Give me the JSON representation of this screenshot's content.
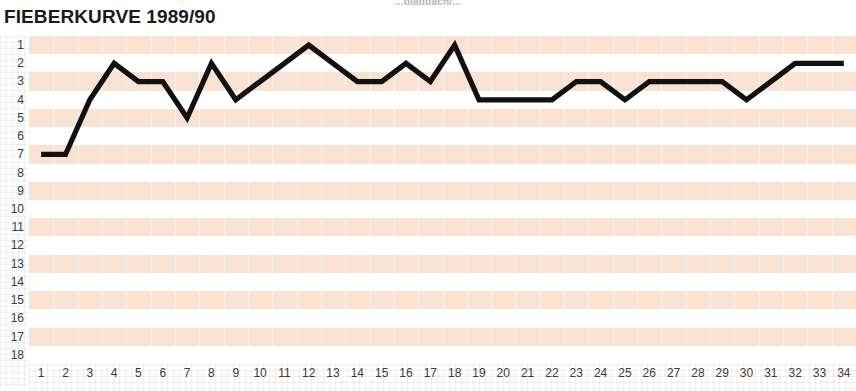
{
  "page": {
    "top_caption": "...gladbach/...",
    "title": "FIEBERKURVE 1989/90"
  },
  "axes": {
    "y_label": "",
    "x_label": "",
    "y_ticks": [
      "1",
      "2",
      "3",
      "4",
      "5",
      "6",
      "7",
      "8",
      "9",
      "10",
      "11",
      "12",
      "13",
      "14",
      "15",
      "16",
      "17",
      "18"
    ],
    "x_ticks": [
      "1",
      "2",
      "3",
      "4",
      "5",
      "6",
      "7",
      "8",
      "9",
      "10",
      "11",
      "12",
      "13",
      "14",
      "15",
      "16",
      "17",
      "18",
      "19",
      "20",
      "21",
      "22",
      "23",
      "24",
      "25",
      "26",
      "27",
      "28",
      "29",
      "30",
      "31",
      "32",
      "33",
      "34"
    ]
  },
  "colors": {
    "band": "#fae2d2",
    "band_alt": "#ffffff",
    "curve": "#111111",
    "text": "#1b1b1b",
    "tick_text": "#3a3a3a"
  },
  "chart_data": {
    "type": "line",
    "title": "FIEBERKURVE 1989/90",
    "xlabel": "",
    "ylabel": "",
    "x": [
      1,
      2,
      3,
      4,
      5,
      6,
      7,
      8,
      9,
      10,
      11,
      12,
      13,
      14,
      15,
      16,
      17,
      18,
      19,
      20,
      21,
      22,
      23,
      24,
      25,
      26,
      27,
      28,
      29,
      30,
      31,
      32,
      33,
      34
    ],
    "values": [
      7,
      7,
      4,
      2,
      3,
      3,
      5,
      2,
      4,
      3,
      2,
      1,
      2,
      3,
      3,
      2,
      3,
      1,
      4,
      4,
      4,
      4,
      3,
      3,
      4,
      3,
      3,
      3,
      3,
      4,
      3,
      2,
      2,
      2
    ],
    "series": [
      {
        "name": "Tabellenplatz",
        "values": [
          7,
          7,
          4,
          2,
          3,
          3,
          5,
          2,
          4,
          3,
          2,
          1,
          2,
          3,
          3,
          2,
          3,
          1,
          4,
          4,
          4,
          4,
          3,
          3,
          4,
          3,
          3,
          3,
          3,
          4,
          3,
          2,
          2,
          2
        ]
      }
    ],
    "xlim": [
      1,
      34
    ],
    "ylim": [
      1,
      18
    ],
    "y_inverted": true,
    "grid": true,
    "legend": "none",
    "annotations": []
  }
}
